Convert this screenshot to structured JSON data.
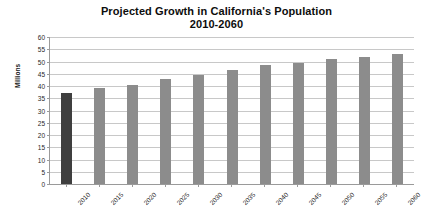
{
  "chart_data": {
    "type": "bar",
    "title": "Projected Growth in California's Population 2010-2060",
    "title_line1": "Projected Growth in California's Population",
    "title_line2": "2010-2060",
    "xlabel": "",
    "ylabel": "Millions",
    "categories": [
      "2010",
      "2015",
      "2020",
      "2025",
      "2030",
      "2035",
      "2040",
      "2045",
      "2050",
      "2055",
      "2060"
    ],
    "values": [
      37,
      39,
      40.5,
      43,
      44.5,
      46.5,
      48.5,
      49.5,
      51,
      52,
      53
    ],
    "ylim": [
      0,
      60
    ],
    "yticks": [
      0,
      5,
      10,
      15,
      20,
      25,
      30,
      35,
      40,
      45,
      50,
      55,
      60
    ],
    "ytick_labels": [
      "0",
      "5",
      "10",
      "15",
      "20",
      "25",
      "30",
      "35",
      "40",
      "45",
      "50",
      "55",
      "60"
    ],
    "grid": true,
    "legend": false,
    "bar_colors": [
      "#3f3f3f",
      "#8c8c8c",
      "#8c8c8c",
      "#8c8c8c",
      "#8c8c8c",
      "#8c8c8c",
      "#8c8c8c",
      "#8c8c8c",
      "#8c8c8c",
      "#8c8c8c",
      "#8c8c8c"
    ],
    "colors": {
      "first_bar": "#3f3f3f",
      "bar": "#8c8c8c",
      "gridline": "#c8c8c8",
      "axis": "#9a9a9a",
      "text": "#1f1f1f",
      "background": "#ffffff"
    }
  }
}
